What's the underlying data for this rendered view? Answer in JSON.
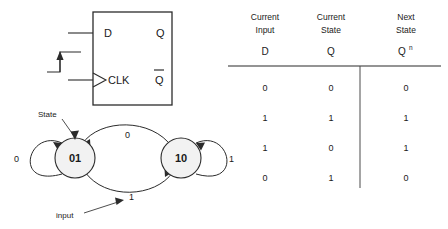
{
  "figure": {
    "flipflop": {
      "name": "d-flip-flop",
      "input_label": "D",
      "output_label": "Q",
      "clock_label": "CLK",
      "inverted_output_label": "Q",
      "inverted_output_has_overbar": true
    },
    "state_diagram": {
      "states": [
        {
          "id": "state-01",
          "label": "01"
        },
        {
          "id": "state-10",
          "label": "10"
        }
      ],
      "transitions": [
        {
          "from": "01",
          "to": "01",
          "label": "0",
          "kind": "self-loop-left"
        },
        {
          "from": "10",
          "to": "01",
          "label": "0",
          "kind": "arc-top"
        },
        {
          "from": "01",
          "to": "10",
          "label": "1",
          "kind": "arc-bottom"
        },
        {
          "from": "10",
          "to": "10",
          "label": "1",
          "kind": "self-loop-right"
        }
      ],
      "annotations": [
        {
          "id": "state-annotation",
          "label": "State"
        },
        {
          "id": "input-annotation",
          "label": "input"
        }
      ]
    },
    "truth_table": {
      "headers": [
        {
          "title_line1": "Current",
          "title_line2": "Input",
          "symbol": "D",
          "symbol_sup": ""
        },
        {
          "title_line1": "Current",
          "title_line2": "State",
          "symbol": "Q",
          "symbol_sup": ""
        },
        {
          "title_line1": "Next",
          "title_line2": "State",
          "symbol": "Q",
          "symbol_sup": "n"
        }
      ],
      "rows": [
        {
          "d": "0",
          "q": "0",
          "qn": "0"
        },
        {
          "d": "1",
          "q": "1",
          "qn": "1"
        },
        {
          "d": "1",
          "q": "0",
          "qn": "1"
        },
        {
          "d": "0",
          "q": "1",
          "qn": "0"
        }
      ]
    }
  },
  "colors": {
    "ink": "#1a1a1a",
    "line": "#2b2b2b",
    "state_fill": "#f2f2f2",
    "background": "#ffffff"
  }
}
